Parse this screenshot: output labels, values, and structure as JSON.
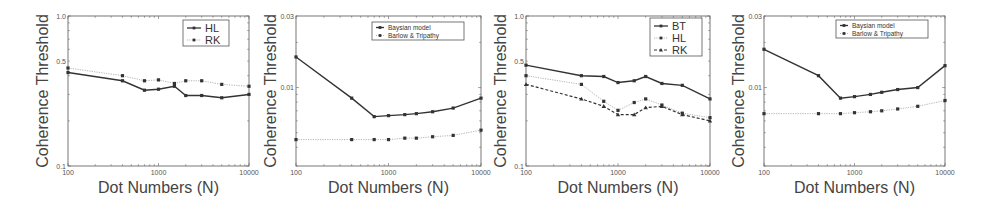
{
  "chart_data": [
    {
      "type": "line",
      "title": "",
      "xlabel": "Dot Numbers (N)",
      "ylabel": "Coherence Threshold",
      "xscale": "log",
      "yscale": "log",
      "xlim": [
        100,
        10000
      ],
      "ylim": [
        0.1,
        1.0
      ],
      "xticks": [
        "100",
        "1000",
        "10000"
      ],
      "yticks": [
        "0.1",
        "0.5",
        "1.0"
      ],
      "grid": false,
      "legend_position": "upper right",
      "x": [
        100,
        400,
        700,
        1000,
        1500,
        2000,
        3000,
        5000,
        10000
      ],
      "series": [
        {
          "name": "HL",
          "style": "solid",
          "marker": "square",
          "color": "#333333",
          "values": [
            0.42,
            0.37,
            0.32,
            0.325,
            0.34,
            0.295,
            0.295,
            0.285,
            0.3
          ]
        },
        {
          "name": "RK",
          "style": "dotted",
          "marker": "square",
          "color": "#aaaaaa",
          "values": [
            0.45,
            0.4,
            0.37,
            0.375,
            0.355,
            0.37,
            0.37,
            0.35,
            0.34
          ]
        }
      ]
    },
    {
      "type": "line",
      "title": "",
      "xlabel": "Dot Numbers (N)",
      "ylabel": "Coherence Threshold",
      "xscale": "log",
      "yscale": "log",
      "xlim": [
        100,
        10000
      ],
      "ylim": [
        0.003,
        0.03
      ],
      "xticks": [
        "100",
        "1000",
        "10000"
      ],
      "yticks": [
        "0.01",
        "0.03"
      ],
      "grid": false,
      "legend_position": "upper center-right",
      "x": [
        100,
        400,
        700,
        1000,
        1500,
        2000,
        3000,
        5000,
        10000
      ],
      "series": [
        {
          "name": "Baysian model",
          "style": "solid",
          "marker": "square",
          "color": "#333333",
          "values": [
            0.016,
            0.0085,
            0.0064,
            0.0065,
            0.0066,
            0.0067,
            0.0069,
            0.0073,
            0.0085
          ]
        },
        {
          "name": "Barlow & Tripathy",
          "style": "dotted",
          "marker": "square",
          "color": "#aaaaaa",
          "values": [
            0.0045,
            0.0045,
            0.0045,
            0.0045,
            0.0046,
            0.0046,
            0.0047,
            0.0048,
            0.0052
          ]
        }
      ]
    },
    {
      "type": "line",
      "title": "",
      "xlabel": "Dot Numbers (N)",
      "ylabel": "Coherence Threshold",
      "xscale": "log",
      "yscale": "log",
      "xlim": [
        100,
        10000
      ],
      "ylim": [
        0.1,
        1.0
      ],
      "xticks": [
        "100",
        "1000",
        "10000"
      ],
      "yticks": [
        "0.1",
        "0.5",
        "1.0"
      ],
      "grid": false,
      "legend_position": "upper right",
      "x": [
        100,
        400,
        700,
        1000,
        1500,
        2000,
        3000,
        5000,
        10000
      ],
      "series": [
        {
          "name": "BT",
          "style": "solid",
          "marker": "square",
          "color": "#333333",
          "values": [
            0.47,
            0.4,
            0.395,
            0.36,
            0.37,
            0.395,
            0.355,
            0.345,
            0.28
          ]
        },
        {
          "name": "HL",
          "style": "dotted",
          "marker": "square",
          "color": "#aaaaaa",
          "values": [
            0.4,
            0.35,
            0.27,
            0.235,
            0.265,
            0.28,
            0.255,
            0.225,
            0.21
          ]
        },
        {
          "name": "RK",
          "style": "dashed",
          "marker": "triangle",
          "color": "#333333",
          "values": [
            0.35,
            0.28,
            0.25,
            0.22,
            0.22,
            0.245,
            0.25,
            0.22,
            0.2
          ]
        }
      ]
    },
    {
      "type": "line",
      "title": "",
      "xlabel": "Dot Numbers (N)",
      "ylabel": "Coherence Threshold",
      "xscale": "log",
      "yscale": "log",
      "xlim": [
        100,
        10000
      ],
      "ylim": [
        0.003,
        0.03
      ],
      "xticks": [
        "100",
        "1000",
        "10000"
      ],
      "yticks": [
        "0.01",
        "0.03"
      ],
      "grid": false,
      "legend_position": "upper center-right",
      "x": [
        100,
        400,
        700,
        1000,
        1500,
        2000,
        3000,
        5000,
        10000
      ],
      "series": [
        {
          "name": "Baysian model",
          "style": "solid",
          "marker": "square",
          "color": "#333333",
          "values": [
            0.018,
            0.012,
            0.0085,
            0.0087,
            0.009,
            0.0093,
            0.0097,
            0.01,
            0.014
          ]
        },
        {
          "name": "Barlow & Tripathy",
          "style": "dotted",
          "marker": "square",
          "color": "#aaaaaa",
          "values": [
            0.0067,
            0.0067,
            0.0067,
            0.0068,
            0.0069,
            0.007,
            0.0072,
            0.0075,
            0.0082
          ]
        }
      ]
    }
  ],
  "layout": [
    {
      "box": [
        68,
        16,
        249,
        166
      ],
      "legend": {
        "x": 183,
        "y": 20,
        "w": 46,
        "h": 26,
        "size": "big"
      },
      "ylabel_x": 48
    },
    {
      "box": [
        296,
        16,
        481,
        166
      ],
      "legend": {
        "x": 372,
        "y": 22,
        "w": 92,
        "h": 18,
        "size": "small"
      },
      "ylabel_x": 276
    },
    {
      "box": [
        526,
        16,
        710,
        166
      ],
      "legend": {
        "x": 650,
        "y": 18,
        "w": 52,
        "h": 38,
        "size": "big"
      },
      "ylabel_x": 506
    },
    {
      "box": [
        764,
        16,
        945,
        166
      ],
      "legend": {
        "x": 836,
        "y": 20,
        "w": 92,
        "h": 18,
        "size": "small"
      },
      "ylabel_x": 744
    }
  ]
}
